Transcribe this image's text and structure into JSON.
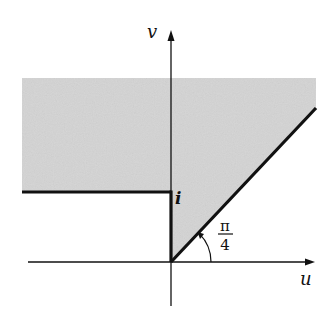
{
  "diagram": {
    "type": "complex-plane-region",
    "axes": {
      "horizontal_label": "u",
      "vertical_label": "v"
    },
    "labels": {
      "point_i": "i",
      "angle_numerator": "π",
      "angle_denominator": "4"
    },
    "colors": {
      "shade": "#d4d4d4",
      "line": "#111111",
      "background": "#ffffff"
    }
  }
}
